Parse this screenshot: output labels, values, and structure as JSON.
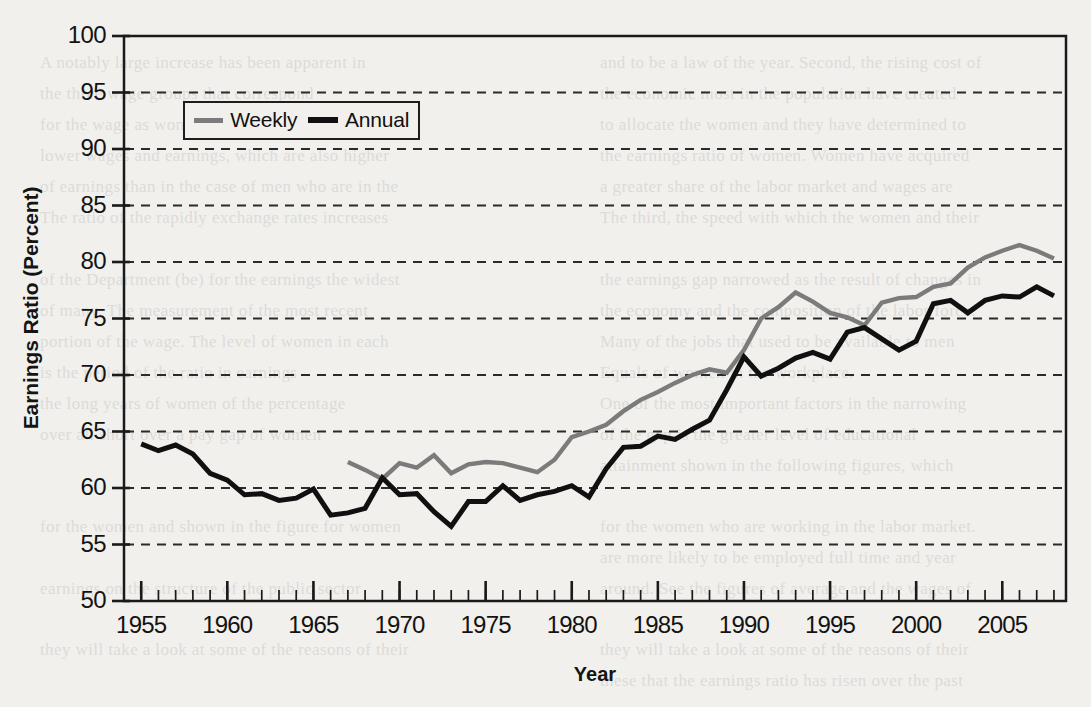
{
  "figure": {
    "background_color": "#f1f0ed",
    "axis_color": "#1a1a1a",
    "grid": true,
    "grid_style": "dashed"
  },
  "axes": {
    "y_title": "Earnings Ratio (Percent)",
    "x_title": "Year",
    "y_ticks": [
      100,
      95,
      90,
      85,
      80,
      75,
      70,
      65,
      60,
      55,
      50
    ],
    "x_ticks": [
      1955,
      1960,
      1965,
      1970,
      1975,
      1980,
      1985,
      1990,
      1995,
      2000,
      2005
    ]
  },
  "legend": {
    "position": "upper-left-inside",
    "entries": [
      {
        "label": "Weekly",
        "color": "#7b7b7b"
      },
      {
        "label": "Annual",
        "color": "#101010"
      }
    ]
  },
  "bleed_text": [
    {
      "x": 600,
      "y": 48,
      "text": "and to be a law of the year. Second, the rising cost of"
    },
    {
      "x": 600,
      "y": 79,
      "text": "the economic most in the population have created"
    },
    {
      "x": 600,
      "y": 110,
      "text": "to allocate the women and they have determined to"
    },
    {
      "x": 600,
      "y": 141,
      "text": "the earnings ratio of women. Women have acquired"
    },
    {
      "x": 600,
      "y": 172,
      "text": "a greater share of the labor market and wages are"
    },
    {
      "x": 600,
      "y": 203,
      "text": "The third, the speed with which the women and their"
    },
    {
      "x": 600,
      "y": 265,
      "text": "the earnings gap narrowed as the result of changes in"
    },
    {
      "x": 600,
      "y": 296,
      "text": "the economy and the composition of the labor force."
    },
    {
      "x": 600,
      "y": 327,
      "text": "Many of the jobs that used to be available to men"
    },
    {
      "x": 600,
      "y": 358,
      "text": "Equals of women in the workplace."
    },
    {
      "x": 600,
      "y": 389,
      "text": "One of the most important factors in the narrowing"
    },
    {
      "x": 600,
      "y": 420,
      "text": "of the gap is the greater level of educational"
    },
    {
      "x": 600,
      "y": 451,
      "text": "attainment shown in the following figures, which"
    },
    {
      "x": 600,
      "y": 512,
      "text": "for the women who are working in the labor market."
    },
    {
      "x": 600,
      "y": 543,
      "text": "are more likely to be employed full time and year"
    },
    {
      "x": 600,
      "y": 574,
      "text": "around. See the figures of average and the wages of"
    },
    {
      "x": 600,
      "y": 635,
      "text": "they will take a look at some of the reasons of their"
    },
    {
      "x": 600,
      "y": 666,
      "text": "these that the earnings ratio has risen over the past"
    },
    {
      "x": 40,
      "y": 48,
      "text": "A notably large increase has been apparent in"
    },
    {
      "x": 40,
      "y": 79,
      "text": "the three wage groups that correspond"
    },
    {
      "x": 40,
      "y": 110,
      "text": "for the wage as women are very low compared"
    },
    {
      "x": 40,
      "y": 141,
      "text": "lower wages and earnings, which are also higher"
    },
    {
      "x": 40,
      "y": 172,
      "text": "of earnings than in the case of men who are in the"
    },
    {
      "x": 40,
      "y": 203,
      "text": "The ratio of the rapidly exchange rates increases"
    },
    {
      "x": 40,
      "y": 265,
      "text": "of the Department (be) for the earnings the widest"
    },
    {
      "x": 40,
      "y": 296,
      "text": "of many. The measurement of the most recent"
    },
    {
      "x": 40,
      "y": 327,
      "text": "portion of the wage. The level of women in each"
    },
    {
      "x": 40,
      "y": 358,
      "text": "is the period of the ratio in earnings"
    },
    {
      "x": 40,
      "y": 389,
      "text": "the long years of women of the percentage"
    },
    {
      "x": 40,
      "y": 420,
      "text": "over all short over a pay gap of women"
    },
    {
      "x": 40,
      "y": 512,
      "text": "for the women and shown in the figure for women"
    },
    {
      "x": 40,
      "y": 574,
      "text": "earnings on the structure of the public sector"
    },
    {
      "x": 40,
      "y": 635,
      "text": "they will take a look at some of the reasons of their"
    }
  ],
  "chart_data": {
    "type": "line",
    "title": "",
    "subtitle": "",
    "xlabel": "Year",
    "ylabel": "Earnings Ratio (Percent)",
    "xlim": [
      1954.0,
      2008.7
    ],
    "ylim": [
      50,
      100
    ],
    "ytick_step": 5,
    "xtick_step": 5,
    "xtick_minor_step": 1,
    "grid": true,
    "legend_position": "upper-left-inside",
    "series": [
      {
        "name": "Annual",
        "color": "#101010",
        "x": [
          1955,
          1956,
          1957,
          1958,
          1959,
          1960,
          1961,
          1962,
          1963,
          1964,
          1965,
          1966,
          1967,
          1968,
          1969,
          1970,
          1971,
          1972,
          1973,
          1974,
          1975,
          1976,
          1977,
          1978,
          1979,
          1980,
          1981,
          1982,
          1983,
          1984,
          1985,
          1986,
          1987,
          1988,
          1989,
          1990,
          1991,
          1992,
          1993,
          1994,
          1995,
          1996,
          1997,
          1998,
          1999,
          2000,
          2001,
          2002,
          2003,
          2004,
          2005,
          2006,
          2007,
          2008
        ],
        "values": [
          63.9,
          63.3,
          63.8,
          63.0,
          61.3,
          60.7,
          59.4,
          59.5,
          58.9,
          59.1,
          59.9,
          57.6,
          57.8,
          58.2,
          60.9,
          59.4,
          59.5,
          57.9,
          56.6,
          58.8,
          58.8,
          60.2,
          58.9,
          59.4,
          59.7,
          60.2,
          59.2,
          61.7,
          63.6,
          63.7,
          64.6,
          64.3,
          65.2,
          66.0,
          68.7,
          71.6,
          69.9,
          70.6,
          71.5,
          72.0,
          71.4,
          73.8,
          74.2,
          73.2,
          72.2,
          73.0,
          76.3,
          76.6,
          75.5,
          76.6,
          77.0,
          76.9,
          77.8,
          77.0
        ]
      },
      {
        "name": "Weekly",
        "color": "#7b7b7b",
        "x": [
          1967,
          1968,
          1969,
          1970,
          1971,
          1972,
          1973,
          1974,
          1975,
          1976,
          1977,
          1978,
          1979,
          1980,
          1981,
          1982,
          1983,
          1984,
          1985,
          1986,
          1987,
          1988,
          1989,
          1990,
          1991,
          1992,
          1993,
          1994,
          1995,
          1996,
          1997,
          1998,
          1999,
          2000,
          2001,
          2002,
          2003,
          2004,
          2005,
          2006,
          2007,
          2008
        ],
        "values": [
          62.3,
          61.6,
          60.8,
          62.2,
          61.8,
          62.9,
          61.3,
          62.1,
          62.3,
          62.2,
          61.8,
          61.4,
          62.5,
          64.5,
          65.0,
          65.6,
          66.8,
          67.8,
          68.5,
          69.3,
          70.0,
          70.5,
          70.2,
          72.2,
          75.0,
          76.0,
          77.3,
          76.5,
          75.5,
          75.1,
          74.4,
          76.4,
          76.8,
          76.9,
          77.8,
          78.1,
          79.5,
          80.4,
          81.0,
          81.5,
          81.0,
          80.3
        ]
      }
    ]
  }
}
